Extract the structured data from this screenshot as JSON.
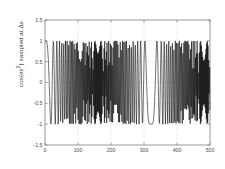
{
  "figure": {
    "background_color": "#ffffff",
    "axes_color": "#808080",
    "grid_color": "#b0b0b0",
    "line_color": "#000000",
    "tick_label_color": "#4a4a4a"
  },
  "axis_labels": {
    "ylabel_prefix": "cos(ex",
    "ylabel_exponent": "2",
    "ylabel_suffix": ") sampled at Δx",
    "ylabel_full": "cos(ex²) sampled at Δx",
    "xlabel": ""
  },
  "chart_data": {
    "type": "line",
    "title": "",
    "xlabel": "",
    "ylabel": "cos(ex²) sampled at Δx",
    "xlim": [
      0,
      500
    ],
    "ylim": [
      -1.5,
      1.5
    ],
    "xticks": [
      0,
      100,
      200,
      300,
      400,
      500
    ],
    "xtick_labels": [
      "0",
      "100",
      "200",
      "300",
      "400",
      "500"
    ],
    "yticks": [
      -1.5,
      -1,
      -0.5,
      0,
      0.5,
      1,
      1.5
    ],
    "ytick_labels": [
      "-1.5",
      "-1",
      "-0.5",
      "0",
      "0.5",
      "1",
      "1.5"
    ],
    "grid": true,
    "grid_style": "dotted",
    "legend": null,
    "series": [
      {
        "name": "cos(ex^2) sampled at dx",
        "description": "Chirp signal cos(e*x^2) evaluated at uniformly spaced sample indices n = 0..500; instantaneous frequency grows linearly with n so the discrete samples alias heavily after roughly n = 60, producing a dense band of values filling the range -1 to 1.",
        "formula": "y[n] = cos(e * (n*dx)^2)",
        "n_points": 501,
        "amplitude": 1.0,
        "y_min": -1.0,
        "y_max": 1.0,
        "chirp_constant_e": 2.718281828,
        "dx": 0.06,
        "quiet_region_end": 55,
        "sample_preview_x": [
          0,
          10,
          20,
          30,
          40,
          50,
          60,
          70,
          80,
          90,
          100
        ],
        "sample_preview_y": [
          1.0,
          0.995,
          0.952,
          0.823,
          0.541,
          0.063,
          -0.545,
          -0.998,
          -0.503,
          0.714,
          0.941
        ]
      }
    ]
  }
}
